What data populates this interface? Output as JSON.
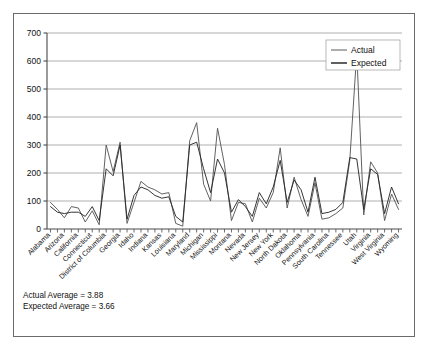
{
  "figure": {
    "border_color": "#6b6b6b",
    "background": "#ffffff"
  },
  "notes": {
    "actual_average": "Actual Average = 3.88",
    "expected_average": "Expected Average = 3.66"
  },
  "caption": "",
  "legend": {
    "position": "top-right",
    "entries": [
      {
        "label": "Actual",
        "color": "#5a5a5a"
      },
      {
        "label": "Expected",
        "color": "#2b2b2b"
      }
    ]
  },
  "chart_data": {
    "type": "line",
    "title": "",
    "xlabel": "",
    "ylabel": "",
    "ylim": [
      0,
      700
    ],
    "yticks": [
      0,
      100,
      200,
      300,
      400,
      500,
      600,
      700
    ],
    "grid": true,
    "grid_axis": "y",
    "tick_label_rotation": -45,
    "categories": [
      "Alabama",
      "Alaska",
      "Arizona",
      "Arkansas",
      "California",
      "Colorado",
      "Connecticut",
      "Delaware",
      "District of Columbia",
      "Florida",
      "Georgia",
      "Hawaii",
      "Idaho",
      "Illinois",
      "Indiana",
      "Iowa",
      "Kansas",
      "Kentucky",
      "Louisiana",
      "Maine",
      "Maryland",
      "Massachusetts",
      "Michigan",
      "Minnesota",
      "Mississippi",
      "Missouri",
      "Montana",
      "Nebraska",
      "Nevada",
      "New Hampshire",
      "New Jersey",
      "New Mexico",
      "New York",
      "North Carolina",
      "North Dakota",
      "Ohio",
      "Oklahoma",
      "Oregon",
      "Pennsylvania",
      "Rhode Island",
      "South Carolina",
      "South Dakota",
      "Tennessee",
      "Texas",
      "Utah",
      "Vermont",
      "Virginia",
      "Washington",
      "West Virginia",
      "Wisconsin",
      "Wyoming"
    ],
    "visible_tick_labels": [
      "Alabama",
      "Arizona",
      "California",
      "Connecticut",
      "District of Columbia",
      "Georgia",
      "Idaho",
      "Indiana",
      "Kansas",
      "Louisiana",
      "Maryland",
      "Michigan",
      "Mississippi",
      "Montana",
      "Nevada",
      "New Jersey",
      "New York",
      "North Dakota",
      "Oklahoma",
      "Pennsylvania",
      "South Carolina",
      "Tennessee",
      "Utah",
      "Virginia",
      "West Virginia",
      "Wyoming"
    ],
    "series": [
      {
        "name": "Actual",
        "color": "#5a5a5a",
        "values": [
          95,
          70,
          40,
          80,
          75,
          25,
          65,
          15,
          300,
          205,
          310,
          20,
          95,
          170,
          150,
          140,
          125,
          130,
          20,
          10,
          315,
          380,
          160,
          100,
          360,
          230,
          30,
          95,
          90,
          25,
          110,
          75,
          130,
          290,
          75,
          185,
          105,
          45,
          165,
          35,
          40,
          55,
          75,
          245,
          630,
          50,
          240,
          200,
          30,
          125,
          70
        ]
      },
      {
        "name": "Expected",
        "color": "#2b2b2b",
        "values": [
          80,
          60,
          55,
          60,
          60,
          45,
          80,
          30,
          215,
          190,
          300,
          35,
          120,
          150,
          140,
          120,
          110,
          115,
          45,
          25,
          300,
          310,
          215,
          130,
          250,
          200,
          60,
          105,
          80,
          45,
          130,
          90,
          150,
          245,
          95,
          175,
          140,
          60,
          185,
          55,
          60,
          70,
          95,
          255,
          250,
          70,
          215,
          195,
          55,
          150,
          90
        ]
      }
    ]
  }
}
